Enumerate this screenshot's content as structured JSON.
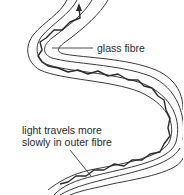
{
  "diagram": {
    "labels": {
      "glass_fibre": "glass fibre",
      "slow_line1": "light travels more",
      "slow_line2": "slowly in outer fibre"
    },
    "colors": {
      "line": "#3a3a3a",
      "ray": "#2a2a2a",
      "background": "#ffffff"
    }
  }
}
